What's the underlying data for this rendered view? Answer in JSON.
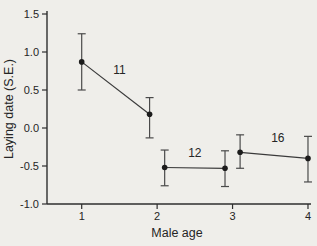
{
  "figure": {
    "background": "#efeeea",
    "ink": "#2e2e2e"
  },
  "chart_data": {
    "type": "line",
    "title": "",
    "ylabel": "Laying date (S.E.)",
    "xlabel": "Male age",
    "ylim": [
      -1.0,
      1.5
    ],
    "xlim": [
      0.54,
      4.04
    ],
    "grid": false,
    "legend": "none",
    "error_bars": true,
    "y_ticks": [
      {
        "value": 1.5,
        "label": "1.5"
      },
      {
        "value": 1.0,
        "label": "1.0"
      },
      {
        "value": 0.5,
        "label": "0.5"
      },
      {
        "value": 0.0,
        "label": "0.0"
      },
      {
        "value": -0.5,
        "label": "-0.5"
      },
      {
        "value": -1.0,
        "label": "-1.0"
      }
    ],
    "x_ticks": [
      {
        "value": 1,
        "label": "1"
      },
      {
        "value": 2,
        "label": "2"
      },
      {
        "value": 3,
        "label": "3"
      },
      {
        "value": 4,
        "label": "4"
      }
    ],
    "series": [
      {
        "n_label": "11",
        "n_label_pos": {
          "x": 1.5,
          "y": 0.76
        },
        "points": [
          {
            "x": 1.0,
            "y": 0.87,
            "err_hi": 1.24,
            "err_lo": 0.5
          },
          {
            "x": 1.9,
            "y": 0.18,
            "err_hi": 0.4,
            "err_lo": -0.13
          }
        ]
      },
      {
        "n_label": "12",
        "n_label_pos": {
          "x": 2.5,
          "y": -0.33
        },
        "points": [
          {
            "x": 2.1,
            "y": -0.52,
            "err_hi": -0.29,
            "err_lo": -0.76
          },
          {
            "x": 2.9,
            "y": -0.53,
            "err_hi": -0.3,
            "err_lo": -0.77
          }
        ]
      },
      {
        "n_label": "16",
        "n_label_pos": {
          "x": 3.6,
          "y": -0.13
        },
        "points": [
          {
            "x": 3.1,
            "y": -0.32,
            "err_hi": -0.09,
            "err_lo": -0.53
          },
          {
            "x": 4.0,
            "y": -0.4,
            "err_hi": -0.11,
            "err_lo": -0.71
          }
        ]
      }
    ]
  }
}
